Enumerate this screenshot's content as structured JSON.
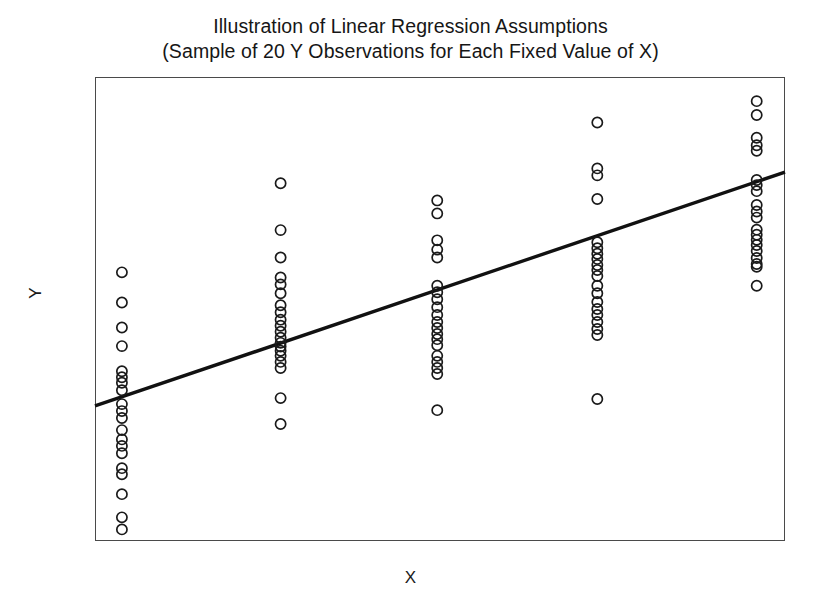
{
  "chart_data": {
    "type": "scatter",
    "title": "Illustration of Linear Regression Assumptions",
    "subtitle": "(Sample of 20 Y Observations for Each Fixed Value of X)",
    "title_line1": "Illustration of Linear Regression Assumptions",
    "title_line2": "(Sample of 20 Y Observations for Each Fixed Value of X)",
    "xlabel": "X",
    "ylabel": "Y",
    "grid": false,
    "legend": false,
    "axis_ticks": false,
    "xlim": [
      0,
      100
    ],
    "ylim": [
      0,
      100
    ],
    "marker": "open-circle",
    "marker_color": "#1a1a1a",
    "marker_fill": "none",
    "line_color": "#111111",
    "frame_color": "#4a4a4a",
    "n_per_group": 20,
    "n_groups": 5,
    "regression_line": {
      "label": "population regression line",
      "x": [
        0,
        100
      ],
      "y": [
        29.1,
        79.5
      ],
      "slope": 0.504,
      "intercept": 29.1
    },
    "groups": [
      {
        "name": "X1",
        "x": 3.9,
        "values": [
          57.9,
          51.4,
          46.0,
          42.0,
          36.6,
          35.3,
          34.1,
          32.5,
          29.5,
          28.0,
          26.5,
          23.9,
          21.9,
          20.5,
          18.9,
          15.7,
          14.4,
          10.1,
          5.1,
          2.5
        ]
      },
      {
        "name": "X2",
        "x": 26.9,
        "values": [
          77.1,
          67.0,
          61.1,
          56.8,
          55.3,
          53.4,
          50.8,
          49.3,
          47.7,
          46.4,
          45.1,
          43.8,
          42.7,
          41.9,
          41.0,
          39.9,
          38.6,
          37.3,
          30.8,
          25.2
        ]
      },
      {
        "name": "X3",
        "x": 49.6,
        "values": [
          73.4,
          70.6,
          64.8,
          62.8,
          61.1,
          55.0,
          53.6,
          52.1,
          50.4,
          48.7,
          47.2,
          45.9,
          44.6,
          43.5,
          42.2,
          39.9,
          38.6,
          37.3,
          36.0,
          28.2
        ]
      },
      {
        "name": "X4",
        "x": 72.8,
        "values": [
          90.2,
          80.3,
          78.8,
          73.7,
          64.4,
          63.1,
          61.9,
          60.8,
          59.5,
          58.4,
          57.1,
          55.0,
          53.4,
          51.5,
          50.0,
          48.7,
          47.2,
          45.7,
          44.4,
          30.6
        ]
      },
      {
        "name": "X5",
        "x": 95.9,
        "values": [
          94.8,
          91.8,
          86.9,
          85.3,
          84.1,
          77.8,
          76.7,
          75.4,
          72.4,
          71.0,
          69.7,
          67.1,
          66.0,
          64.9,
          63.8,
          62.5,
          61.0,
          59.7,
          59.1,
          55.0
        ]
      }
    ]
  },
  "figure": {
    "name": "linear-regression-assumptions-figure"
  },
  "axes": {
    "x_title": "X",
    "y_title": "Y"
  }
}
